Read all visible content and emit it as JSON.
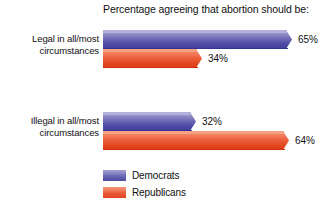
{
  "chart_data": {
    "type": "bar",
    "orientation": "horizontal",
    "title": "Percentage agreeing that abortion should be:",
    "xlabel": "",
    "ylabel": "",
    "xlim": [
      0,
      100
    ],
    "grid": false,
    "legend_position": "bottom-left",
    "categories": [
      "Legal in all/most circumstances",
      "Illegal in all/most circumstances"
    ],
    "category_lines": [
      [
        "Legal in all/most",
        "circumstances"
      ],
      [
        "Illegal in all/most",
        "circumstances"
      ]
    ],
    "series": [
      {
        "name": "Democrats",
        "color": "#4a49a0",
        "values": [
          65,
          32
        ],
        "labels": [
          "65%",
          "32%"
        ]
      },
      {
        "name": "Republicans",
        "color": "#e2471f",
        "values": [
          34,
          64
        ],
        "labels": [
          "34%",
          "64%"
        ]
      }
    ]
  },
  "legend": {
    "items": [
      {
        "label": "Democrats",
        "swatch": "democrats-swatch"
      },
      {
        "label": "Republicans",
        "swatch": "republicans-swatch"
      }
    ]
  }
}
